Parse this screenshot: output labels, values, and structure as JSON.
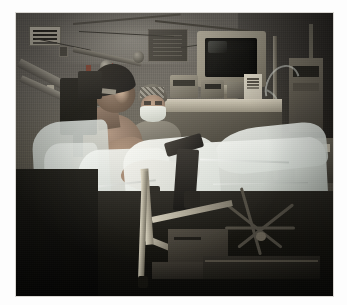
{
  "image": {
    "kind": "photograph",
    "scene_title": "Operating room: awake patient in stereotactic head frame",
    "setting": "hospital operating / procedure room",
    "palette": {
      "wall": "#66625b",
      "wall_shadow": "#3a372f",
      "drape_light": "#e9ece8",
      "drape_mid": "#c2c9c3",
      "skin": "#a98d78",
      "equipment_beige": "#bdb6a4",
      "metal": "#9a9589",
      "dark_frame": "#15140f",
      "floor": "#15140f",
      "border": "#ffffff"
    },
    "border": {
      "color": "#ffffff",
      "left": 16,
      "top": 13,
      "right": 14,
      "bottom": 9
    }
  },
  "regions": {
    "wall": {
      "label": "operating room wall",
      "note": "tiled grey-green wall, upper 63% of frame"
    },
    "floor": {
      "label": "floor",
      "note": "dark shadowed floor, lower third"
    }
  },
  "subjects": [
    {
      "name": "patient",
      "label": "Patient in stereotactic head frame",
      "position": "left foreground",
      "details": "seated semi-upright, bare torso, dark head cap, head fixed in frame, draped in sheeting"
    },
    {
      "name": "clinician",
      "label": "Masked clinician",
      "position": "center background",
      "details": "surgical cap and face mask, standing beside the bed"
    }
  ],
  "objects": [
    {
      "name": "stereotactic-arm",
      "label": "Stereotactic positioning arm"
    },
    {
      "name": "head-fixation-block",
      "label": "Head fixation block"
    },
    {
      "name": "crt-monitor",
      "label": "CRT display monitor",
      "screen_state": "off / dark"
    },
    {
      "name": "equipment-cart",
      "label": "Equipment cart"
    },
    {
      "name": "monitoring-device",
      "label": "Patient monitoring device"
    },
    {
      "name": "infusion-pole",
      "label": "IV / infusion pole"
    },
    {
      "name": "iv-tubing",
      "label": "IV tubing loops"
    },
    {
      "name": "equipment-tower",
      "label": "Anesthesia equipment tower"
    },
    {
      "name": "surgical-drape",
      "label": "Surgical drape sheeting"
    },
    {
      "name": "operating-table",
      "label": "Operating table with rail"
    },
    {
      "name": "support-rod",
      "label": "Table support rods and clamps"
    },
    {
      "name": "restraint-strap",
      "label": "Restraint strap"
    },
    {
      "name": "rolling-stool",
      "label": "Rolling stool base"
    },
    {
      "name": "storage-box",
      "label": "Storage box on floor"
    },
    {
      "name": "wall-sign",
      "label": "Wall notice sign"
    },
    {
      "name": "wall-board",
      "label": "Wall-mounted board"
    },
    {
      "name": "wall-outlet",
      "label": "Wall gas / power outlet"
    },
    {
      "name": "ceiling-cable",
      "label": "Overhead cable run"
    },
    {
      "name": "chart-papers",
      "label": "Chart papers on cart"
    }
  ]
}
